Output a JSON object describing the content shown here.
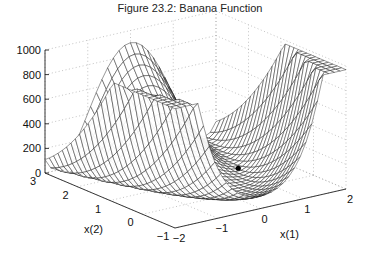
{
  "figure": {
    "title": "Figure 23.2: Banana Function"
  },
  "chart_data": {
    "type": "surface",
    "title": "Figure 23.2: Banana Function",
    "function": "f(x) = 100*(x(2) - x(1)^2)^2 + (1 - x(1))^2",
    "xlabel": "x(1)",
    "ylabel": "x(2)",
    "zlabel": "",
    "xlim": [
      -2,
      2
    ],
    "ylim": [
      -1,
      3
    ],
    "zlim": [
      0,
      1000
    ],
    "xticks": [
      -2,
      -1,
      0,
      1,
      2
    ],
    "yticks": [
      -1,
      0,
      1,
      2,
      3
    ],
    "zticks": [
      0,
      200,
      400,
      600,
      800,
      1000
    ],
    "grid": true,
    "grid_style": "dotted",
    "mesh_resolution": 30,
    "minimum_marker": {
      "x1": 1,
      "x2": 1,
      "z": 0,
      "label": ""
    },
    "surface_samples": [
      {
        "x1": -2,
        "x2": -1,
        "z": 2509
      },
      {
        "x1": -2,
        "x2": 3,
        "z": 109
      },
      {
        "x1": 0,
        "x2": -1,
        "z": 101
      },
      {
        "x1": 0,
        "x2": 3,
        "z": 901
      },
      {
        "x1": 2,
        "x2": -1,
        "z": 2501
      },
      {
        "x1": 2,
        "x2": 3,
        "z": 101
      },
      {
        "x1": 1,
        "x2": 1,
        "z": 0
      }
    ]
  },
  "colors": {
    "mesh": "#1a1a1a",
    "grid": "#9a9a9a",
    "axis": "#222222",
    "marker": "#000000"
  }
}
